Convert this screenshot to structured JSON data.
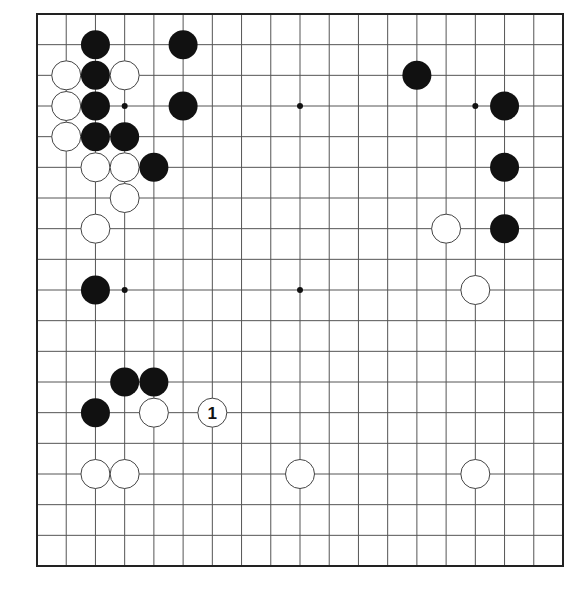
{
  "diagram": {
    "type": "go-board",
    "size": 19,
    "colors": {
      "background": "#ffffff",
      "grid_line": "#555555",
      "border": "#222222",
      "black_stone": "#111111",
      "white_stone_fill": "#ffffff",
      "white_stone_outline": "#444444",
      "star_point": "#111111"
    },
    "star_points": [
      {
        "col": 3,
        "row": 3
      },
      {
        "col": 9,
        "row": 3
      },
      {
        "col": 15,
        "row": 3
      },
      {
        "col": 3,
        "row": 9
      },
      {
        "col": 9,
        "row": 9
      },
      {
        "col": 15,
        "row": 9
      },
      {
        "col": 3,
        "row": 15
      },
      {
        "col": 9,
        "row": 15
      },
      {
        "col": 15,
        "row": 15
      }
    ],
    "stones": [
      {
        "color": "black",
        "col": 2,
        "row": 1
      },
      {
        "color": "black",
        "col": 5,
        "row": 1
      },
      {
        "color": "white",
        "col": 1,
        "row": 2
      },
      {
        "color": "black",
        "col": 2,
        "row": 2
      },
      {
        "color": "white",
        "col": 3,
        "row": 2
      },
      {
        "color": "black",
        "col": 13,
        "row": 2
      },
      {
        "color": "white",
        "col": 1,
        "row": 3
      },
      {
        "color": "black",
        "col": 2,
        "row": 3
      },
      {
        "color": "black",
        "col": 5,
        "row": 3
      },
      {
        "color": "black",
        "col": 16,
        "row": 3
      },
      {
        "color": "white",
        "col": 1,
        "row": 4
      },
      {
        "color": "black",
        "col": 2,
        "row": 4
      },
      {
        "color": "black",
        "col": 3,
        "row": 4
      },
      {
        "color": "white",
        "col": 2,
        "row": 5
      },
      {
        "color": "white",
        "col": 3,
        "row": 5
      },
      {
        "color": "black",
        "col": 4,
        "row": 5
      },
      {
        "color": "black",
        "col": 16,
        "row": 5
      },
      {
        "color": "white",
        "col": 3,
        "row": 6
      },
      {
        "color": "white",
        "col": 2,
        "row": 7
      },
      {
        "color": "white",
        "col": 14,
        "row": 7
      },
      {
        "color": "black",
        "col": 16,
        "row": 7
      },
      {
        "color": "black",
        "col": 2,
        "row": 9
      },
      {
        "color": "white",
        "col": 15,
        "row": 9
      },
      {
        "color": "black",
        "col": 3,
        "row": 12
      },
      {
        "color": "black",
        "col": 4,
        "row": 12
      },
      {
        "color": "black",
        "col": 2,
        "row": 13
      },
      {
        "color": "white",
        "col": 4,
        "row": 13
      },
      {
        "color": "white",
        "col": 6,
        "row": 13,
        "label": "1"
      },
      {
        "color": "white",
        "col": 2,
        "row": 15
      },
      {
        "color": "white",
        "col": 3,
        "row": 15
      },
      {
        "color": "white",
        "col": 9,
        "row": 15
      },
      {
        "color": "white",
        "col": 15,
        "row": 15
      }
    ]
  }
}
